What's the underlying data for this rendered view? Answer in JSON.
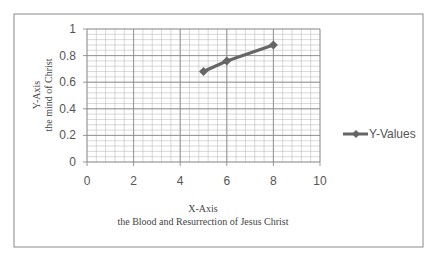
{
  "chart_data": {
    "type": "line",
    "title": "",
    "xlabel": "X-Axis\nthe Blood and Resurrection of Jesus Christ",
    "xlabel_lines": [
      "X-Axis",
      "the Blood and Resurrection of Jesus Christ"
    ],
    "ylabel": "Y-Axis\nthe mind of Christ",
    "ylabel_lines": [
      "Y-Axis",
      "the mind of Christ"
    ],
    "xlim": [
      0,
      10
    ],
    "ylim": [
      0,
      1
    ],
    "x_ticks": [
      "0",
      "2",
      "4",
      "6",
      "8",
      "10"
    ],
    "y_ticks": [
      "0",
      "0.2",
      "0.4",
      "0.6",
      "0.8",
      "1"
    ],
    "grid": true,
    "legend_position": "right",
    "series": [
      {
        "name": "Y-Values",
        "x": [
          5,
          6,
          8
        ],
        "values": [
          0.68,
          0.76,
          0.88
        ],
        "color": "#666666",
        "marker": "diamond"
      }
    ]
  }
}
